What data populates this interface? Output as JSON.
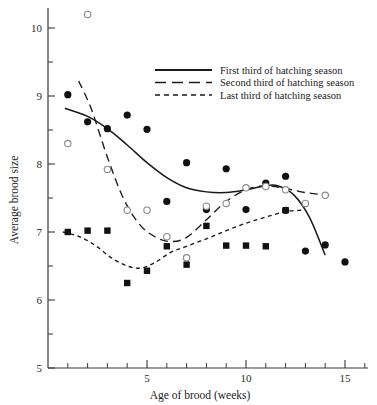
{
  "chart_data": {
    "type": "scatter",
    "title": "",
    "xlabel": "Age of brood (weeks)",
    "ylabel": "Average brood size",
    "xlim": [
      0,
      16.2
    ],
    "ylim": [
      5,
      10.5
    ],
    "xticks_major": [
      5,
      10,
      15
    ],
    "xticks_minor": [
      1,
      2,
      3,
      4,
      6,
      7,
      8,
      9,
      11,
      12,
      13,
      14,
      16
    ],
    "yticks_major": [
      5,
      6,
      7,
      8,
      9,
      10
    ],
    "yticks_minor": [
      5.5,
      6.5,
      7.5,
      8.5,
      9.5,
      10.5
    ],
    "grid": false,
    "legend_position": "upper right",
    "series": [
      {
        "name": "First third of hatching season",
        "marker": "filled-circle",
        "line_style": "solid",
        "points": [
          {
            "x": 1,
            "y": 9.02
          },
          {
            "x": 2,
            "y": 8.62
          },
          {
            "x": 3,
            "y": 8.52
          },
          {
            "x": 4,
            "y": 8.72
          },
          {
            "x": 5,
            "y": 8.51
          },
          {
            "x": 6,
            "y": 7.45
          },
          {
            "x": 7,
            "y": 8.02
          },
          {
            "x": 8,
            "y": 7.33
          },
          {
            "x": 9,
            "y": 7.93
          },
          {
            "x": 10,
            "y": 7.33
          },
          {
            "x": 11,
            "y": 7.72
          },
          {
            "x": 12,
            "y": 7.82
          },
          {
            "x": 12,
            "y": 7.32
          },
          {
            "x": 13,
            "y": 6.72
          },
          {
            "x": 14,
            "y": 6.81
          },
          {
            "x": 15,
            "y": 6.56
          }
        ],
        "curve": [
          {
            "x": 0.85,
            "y": 8.82
          },
          {
            "x": 2.0,
            "y": 8.7
          },
          {
            "x": 3.0,
            "y": 8.52
          },
          {
            "x": 4.0,
            "y": 8.28
          },
          {
            "x": 5.0,
            "y": 8.02
          },
          {
            "x": 6.0,
            "y": 7.8
          },
          {
            "x": 7.0,
            "y": 7.65
          },
          {
            "x": 8.0,
            "y": 7.59
          },
          {
            "x": 9.0,
            "y": 7.58
          },
          {
            "x": 10.0,
            "y": 7.62
          },
          {
            "x": 11.0,
            "y": 7.68
          },
          {
            "x": 11.6,
            "y": 7.68
          },
          {
            "x": 12.4,
            "y": 7.55
          },
          {
            "x": 13.2,
            "y": 7.22
          },
          {
            "x": 14.0,
            "y": 6.66
          }
        ]
      },
      {
        "name": "Second third of hatching season",
        "marker": "open-circle",
        "line_style": "dashed-long",
        "points": [
          {
            "x": 2,
            "y": 10.2
          },
          {
            "x": 1,
            "y": 8.3
          },
          {
            "x": 3,
            "y": 7.92
          },
          {
            "x": 4,
            "y": 7.32
          },
          {
            "x": 5,
            "y": 7.32
          },
          {
            "x": 6,
            "y": 6.93
          },
          {
            "x": 7,
            "y": 6.62
          },
          {
            "x": 8,
            "y": 7.38
          },
          {
            "x": 9,
            "y": 7.42
          },
          {
            "x": 10,
            "y": 7.65
          },
          {
            "x": 11,
            "y": 7.67
          },
          {
            "x": 12,
            "y": 7.62
          },
          {
            "x": 13,
            "y": 7.42
          },
          {
            "x": 14,
            "y": 7.54
          }
        ],
        "curve": [
          {
            "x": 1.55,
            "y": 9.22
          },
          {
            "x": 2.2,
            "y": 8.8
          },
          {
            "x": 3.0,
            "y": 8.1
          },
          {
            "x": 3.8,
            "y": 7.5
          },
          {
            "x": 4.6,
            "y": 7.12
          },
          {
            "x": 5.4,
            "y": 6.93
          },
          {
            "x": 6.2,
            "y": 6.86
          },
          {
            "x": 7.0,
            "y": 6.92
          },
          {
            "x": 8.0,
            "y": 7.18
          },
          {
            "x": 9.0,
            "y": 7.45
          },
          {
            "x": 10.0,
            "y": 7.62
          },
          {
            "x": 11.0,
            "y": 7.68
          },
          {
            "x": 12.0,
            "y": 7.64
          },
          {
            "x": 13.0,
            "y": 7.58
          },
          {
            "x": 14.2,
            "y": 7.54
          }
        ]
      },
      {
        "name": "Last third of hatching season",
        "marker": "filled-square",
        "line_style": "dashed-short",
        "points": [
          {
            "x": 1,
            "y": 7.0
          },
          {
            "x": 2,
            "y": 7.02
          },
          {
            "x": 3,
            "y": 7.02
          },
          {
            "x": 4,
            "y": 6.25
          },
          {
            "x": 5,
            "y": 6.43
          },
          {
            "x": 6,
            "y": 6.79
          },
          {
            "x": 7,
            "y": 6.52
          },
          {
            "x": 8,
            "y": 7.09
          },
          {
            "x": 9,
            "y": 6.8
          },
          {
            "x": 10,
            "y": 6.8
          },
          {
            "x": 11,
            "y": 6.79
          },
          {
            "x": 12,
            "y": 7.32
          }
        ],
        "curve": [
          {
            "x": 0.75,
            "y": 7.0
          },
          {
            "x": 1.6,
            "y": 6.93
          },
          {
            "x": 2.4,
            "y": 6.8
          },
          {
            "x": 3.2,
            "y": 6.62
          },
          {
            "x": 4.0,
            "y": 6.5
          },
          {
            "x": 4.7,
            "y": 6.47
          },
          {
            "x": 5.4,
            "y": 6.55
          },
          {
            "x": 6.2,
            "y": 6.7
          },
          {
            "x": 7.0,
            "y": 6.79
          },
          {
            "x": 8.0,
            "y": 6.9
          },
          {
            "x": 9.0,
            "y": 7.02
          },
          {
            "x": 10.0,
            "y": 7.13
          },
          {
            "x": 11.0,
            "y": 7.22
          },
          {
            "x": 12.0,
            "y": 7.3
          },
          {
            "x": 12.8,
            "y": 7.32
          }
        ]
      }
    ]
  },
  "axes": {
    "y_title": "Average brood size",
    "x_title": "Age of brood (weeks)",
    "x_tick_labels": [
      "5",
      "10",
      "15"
    ],
    "y_tick_labels": [
      "10",
      "9",
      "8",
      "7",
      "6",
      "5"
    ]
  },
  "legend": {
    "items": [
      {
        "label": "First third of hatching season",
        "style": "solid"
      },
      {
        "label": "Second third of hatching season",
        "style": "dashed-long"
      },
      {
        "label": "Last third of hatching season",
        "style": "dashed-short"
      }
    ]
  },
  "colors": {
    "ink": "#1a1a1a",
    "axis": "#3a3a3a",
    "marker_open_stroke": "#8a8a8a",
    "background": "#ffffff"
  }
}
